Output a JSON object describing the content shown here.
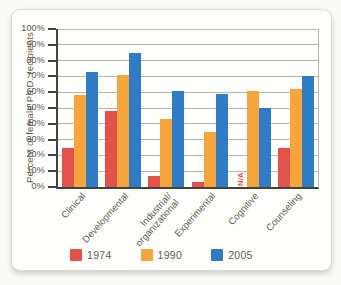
{
  "chart_data": {
    "type": "bar",
    "title": "",
    "xlabel": "",
    "ylabel": "Percent of female Ph.D. recipients",
    "categories": [
      "Clinical",
      "Developmental",
      "Industrial/\norganizational",
      "Experimental",
      "Cognitive",
      "Counseling"
    ],
    "series": [
      {
        "name": "1974",
        "color": "#e2514a",
        "values": [
          25,
          48,
          7,
          3,
          null,
          25
        ]
      },
      {
        "name": "1990",
        "color": "#f5a53c",
        "values": [
          58,
          71,
          43,
          35,
          61,
          62
        ]
      },
      {
        "name": "2005",
        "color": "#2f7bc4",
        "values": [
          73,
          85,
          61,
          59,
          50,
          70
        ]
      }
    ],
    "na_label": "N/A",
    "ylim": [
      0,
      100
    ],
    "ytick_step": 10,
    "ytick_suffix": "%",
    "grid": true,
    "legend_position": "bottom",
    "colors": {
      "gridline": "#b9b5aa",
      "axis": "#45423b",
      "text": "#5f5b52",
      "na_text": "#d6493f"
    }
  }
}
